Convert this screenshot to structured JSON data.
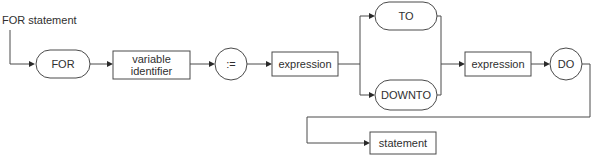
{
  "diagram": {
    "title": "FOR statement",
    "type": "syntax-diagram",
    "nodes": {
      "for_keyword": "FOR",
      "variable_identifier": "variable\nidentifier",
      "assign": ":=",
      "expression_start": "expression",
      "to_keyword": "TO",
      "downto_keyword": "DOWNTO",
      "expression_end": "expression",
      "do_keyword": "DO",
      "statement": "statement"
    },
    "colors": {
      "line": "#4a4a4a",
      "text": "#2f2f2f",
      "background": "#ffffff"
    }
  }
}
